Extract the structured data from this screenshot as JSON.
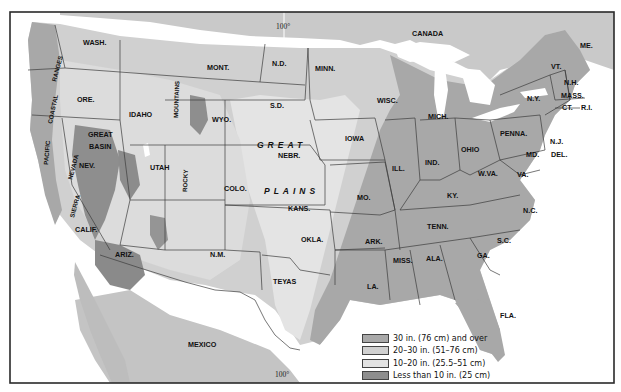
{
  "map": {
    "title": "Average annual precipitation, conterminous United States",
    "meridian_label": "100°",
    "meridian_label_bottom": "100°",
    "country_labels": [
      "CANADA",
      "MEXICO"
    ],
    "colors": {
      "ocean": "#ffffff",
      "lakes": "#ffffff",
      "canada_mexico": "#cbcbcb",
      "zone_30_plus": "#a9a9a9",
      "zone_20_30": "#d0d0d0",
      "zone_10_20": "#e6e6e6",
      "zone_under_10": "#8e8e8e"
    },
    "states": {
      "wash": "WASH.",
      "ore": "ORE.",
      "calif": "CALIF.",
      "nev": "NEV.",
      "idaho": "IDAHO",
      "mont": "MONT.",
      "wyo": "WYO.",
      "utah": "UTAH",
      "ariz": "ARIZ.",
      "colo": "COLO.",
      "nm": "N.M.",
      "nd": "N.D.",
      "sd": "S.D.",
      "nebr": "NEBR.",
      "kans": "KANS.",
      "okla": "OKLA.",
      "texas": "TEYAS",
      "minn": "MINN.",
      "iowa": "IOWA",
      "mo": "MO.",
      "ark": "ARK.",
      "la": "LA.",
      "wisc": "WISC.",
      "ill": "ILL.",
      "mich": "MICH.",
      "ind": "IND.",
      "ohio": "OHIO",
      "ky": "KY.",
      "tenn": "TENN.",
      "miss": "MISS.",
      "ala": "ALA.",
      "ga": "GA.",
      "fla": "FLA.",
      "sc": "S.C.",
      "nc": "N.C.",
      "va": "VA.",
      "wva": "W.VA.",
      "md": "MD.",
      "del": "DEL.",
      "nj": "N.J.",
      "penna": "PENNA.",
      "ny": "N.Y.",
      "vt": "VT.",
      "nh": "N.H.",
      "me": "ME.",
      "mass": "MASS.",
      "ct": "CT.",
      "ri": "R.I."
    },
    "regions": {
      "great": "GREAT",
      "plains": "PLAINS",
      "great_basin_1": "GREAT",
      "great_basin_2": "BASIN",
      "coastal": "COASTAL",
      "ranges": "RANGES",
      "pacific": "PACIFIC",
      "sierra": "SIERRA",
      "nevada": "NEVADA",
      "rocky": "ROCKY",
      "mountains": "MOUNTAINS"
    }
  },
  "legend": {
    "items": [
      {
        "label": "30 in. (76 cm) and over",
        "color": "#a9a9a9"
      },
      {
        "label": "20–30 in. (51–76 cm)",
        "color": "#d0d0d0"
      },
      {
        "label": "10–20 in. (25.5–51 cm)",
        "color": "#e3e3e3"
      },
      {
        "label": "Less than 10 in. (25 cm)",
        "color": "#8e8e8e"
      }
    ]
  }
}
